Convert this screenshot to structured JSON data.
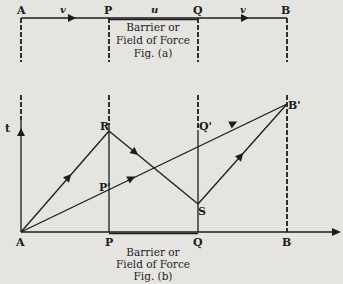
{
  "figure_a": {
    "points": [
      "A",
      "P",
      "Q",
      "B"
    ],
    "velocity_labels": [
      "v",
      "u",
      "v"
    ],
    "region_label_line1": "Barrier or",
    "region_label_line2": "Field of Force",
    "caption": "Fig. (a)"
  },
  "figure_b": {
    "axis_t_label": "t",
    "baseline_points": [
      "A",
      "P",
      "Q",
      "B"
    ],
    "point_labels": {
      "R": "R",
      "S": "S",
      "P_prime": "P'",
      "Q_prime": "Q'",
      "B_prime": "B'"
    },
    "region_label_line1": "Barrier or",
    "region_label_line2": "Field of Force",
    "caption": "Fig. (b)"
  },
  "colors": {
    "ink": "#1c1c1c",
    "paper": "#e6e4e1"
  }
}
